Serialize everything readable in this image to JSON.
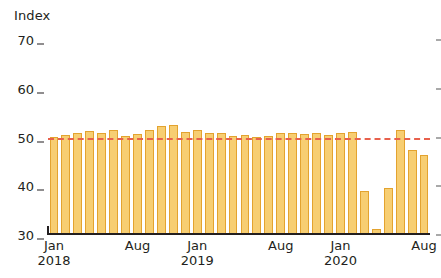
{
  "axis_title": "Index",
  "chart_data": {
    "type": "bar",
    "title": "",
    "subtitle": "",
    "xlabel": "",
    "ylabel": "Index",
    "ylim": [
      30,
      70
    ],
    "yticks": [
      30,
      40,
      50,
      60,
      70
    ],
    "ytick_labels": [
      "30",
      "40",
      "50",
      "60",
      "70"
    ],
    "grid": false,
    "legend": "none",
    "bar_color": "#f7ce72",
    "bar_edge_color": "#e3a32f",
    "reference_line": {
      "value": 50,
      "color": "#e8604c",
      "style": "dashed",
      "label": ""
    },
    "x": [
      "Jan 2018",
      "Feb 2018",
      "Mar 2018",
      "Apr 2018",
      "May 2018",
      "Jun 2018",
      "Jul 2018",
      "Aug 2018",
      "Sep 2018",
      "Oct 2018",
      "Nov 2018",
      "Dec 2018",
      "Jan 2019",
      "Feb 2019",
      "Mar 2019",
      "Apr 2019",
      "May 2019",
      "Jun 2019",
      "Jul 2019",
      "Aug 2019",
      "Sep 2019",
      "Oct 2019",
      "Nov 2019",
      "Dec 2019",
      "Jan 2020",
      "Feb 2020",
      "Mar 2020",
      "Apr 2020",
      "May 2020",
      "Jun 2020",
      "Jul 2020",
      "Aug 2020"
    ],
    "categories": [
      "Jan 2018",
      "Feb 2018",
      "Mar 2018",
      "Apr 2018",
      "May 2018",
      "Jun 2018",
      "Jul 2018",
      "Aug 2018",
      "Sep 2018",
      "Oct 2018",
      "Nov 2018",
      "Dec 2018",
      "Jan 2019",
      "Feb 2019",
      "Mar 2019",
      "Apr 2019",
      "May 2019",
      "Jun 2019",
      "Jul 2019",
      "Aug 2019",
      "Sep 2019",
      "Oct 2019",
      "Nov 2019",
      "Dec 2019",
      "Jan 2020",
      "Feb 2020",
      "Mar 2020",
      "Apr 2020",
      "May 2020",
      "Jun 2020",
      "Jul 2020",
      "Aug 2020"
    ],
    "values": [
      50.2,
      50.5,
      51.0,
      51.4,
      50.9,
      51.5,
      50.3,
      50.8,
      51.5,
      52.3,
      52.5,
      51.2,
      51.5,
      51.0,
      50.9,
      50.3,
      50.5,
      50.2,
      50.4,
      51.0,
      51.0,
      50.7,
      50.9,
      50.6,
      51.0,
      51.2,
      39.0,
      31.2,
      39.6,
      51.6,
      47.4,
      46.4
    ],
    "xtick_labels": [
      {
        "month": "Jan",
        "year": "2018",
        "index": 0
      },
      {
        "month": "Aug",
        "year": "",
        "index": 7
      },
      {
        "month": "Jan",
        "year": "2019",
        "index": 12
      },
      {
        "month": "Aug",
        "year": "",
        "index": 19
      },
      {
        "month": "Jan",
        "year": "2020",
        "index": 24
      },
      {
        "month": "Aug",
        "year": "",
        "index": 31
      }
    ]
  }
}
